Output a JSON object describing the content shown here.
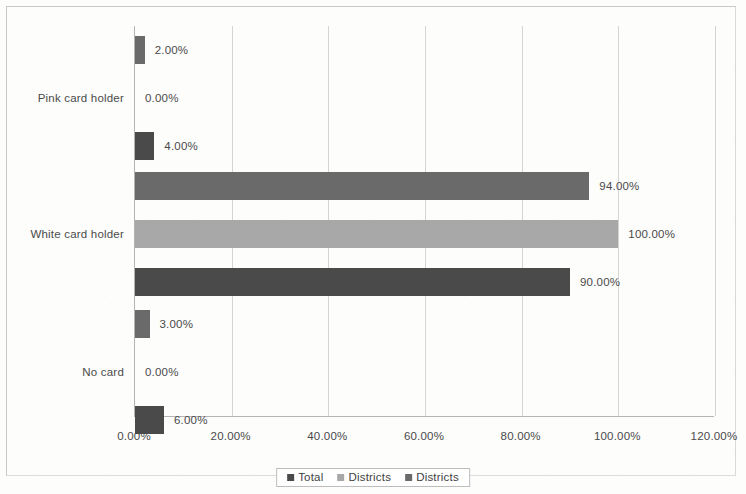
{
  "chart_data": {
    "type": "bar",
    "orientation": "horizontal",
    "title": "",
    "subtitle": "",
    "xlabel": "",
    "ylabel": "",
    "xlim": [
      0,
      120
    ],
    "xtick_labels": [
      "0.00%",
      "20.00%",
      "40.00%",
      "60.00%",
      "80.00%",
      "100.00%",
      "120.00%"
    ],
    "xtick_values": [
      0,
      20,
      40,
      60,
      80,
      100,
      120
    ],
    "grid": true,
    "grid_axis": "x",
    "legend_position": "bottom",
    "categories": [
      "Pink card holder",
      "White card holder",
      "No card"
    ],
    "series": [
      {
        "name": "Total",
        "color": "#4a4a4a",
        "values": [
          4,
          90,
          6
        ],
        "value_labels": [
          "4.00%",
          "90.00%",
          "6.00%"
        ]
      },
      {
        "name": "Districts",
        "color": "#a8a8a8",
        "values": [
          0,
          100,
          0
        ],
        "value_labels": [
          "0.00%",
          "100.00%",
          "0.00%"
        ]
      },
      {
        "name": "Districts",
        "color": "#6a6a6a",
        "values": [
          2,
          94,
          3
        ],
        "value_labels": [
          "2.00%",
          "94.00%",
          "3.00%"
        ]
      }
    ],
    "legend": [
      {
        "label": "Total",
        "color": "#4a4a4a"
      },
      {
        "label": "Districts",
        "color": "#a8a8a8"
      },
      {
        "label": "Districts",
        "color": "#6a6a6a"
      }
    ],
    "groups": [
      {
        "category": "Pink card holder",
        "bars": [
          {
            "series": "Districts",
            "value": 2,
            "label": "2.00%",
            "color": "#6a6a6a"
          },
          {
            "series": "Districts",
            "value": 0,
            "label": "0.00%",
            "color": "#a8a8a8"
          },
          {
            "series": "Total",
            "value": 4,
            "label": "4.00%",
            "color": "#4a4a4a"
          }
        ]
      },
      {
        "category": "White card holder",
        "bars": [
          {
            "series": "Districts",
            "value": 94,
            "label": "94.00%",
            "color": "#6a6a6a"
          },
          {
            "series": "Districts",
            "value": 100,
            "label": "100.00%",
            "color": "#a8a8a8"
          },
          {
            "series": "Total",
            "value": 90,
            "label": "90.00%",
            "color": "#4a4a4a"
          }
        ]
      },
      {
        "category": "No card",
        "bars": [
          {
            "series": "Districts",
            "value": 3,
            "label": "3.00%",
            "color": "#6a6a6a"
          },
          {
            "series": "Districts",
            "value": 0,
            "label": "0.00%",
            "color": "#a8a8a8"
          },
          {
            "series": "Total",
            "value": 6,
            "label": "6.00%",
            "color": "#4a4a4a"
          }
        ]
      }
    ]
  },
  "colors": {
    "series_dark": "#4a4a4a",
    "series_light": "#a8a8a8",
    "series_medium": "#6a6a6a",
    "axis": "#b4b4b4",
    "gridline": "#d5d5d5",
    "text": "#4a4a4a",
    "frame": "#c9c9c9",
    "background": "#fdfdfc"
  }
}
